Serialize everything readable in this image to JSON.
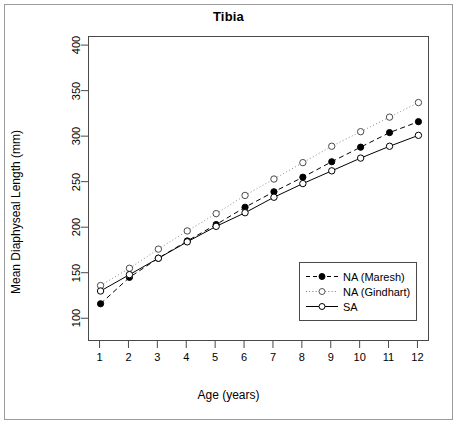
{
  "figure": {
    "title": "Tibia",
    "xlabel": "Age (years)",
    "ylabel": "Mean Diaphyseal Length (mm)"
  },
  "legend": {
    "items": [
      {
        "label": "NA (Maresh)",
        "key": "dashed-filled-circle"
      },
      {
        "label": "NA (Gindhart)",
        "key": "dotted-open-circle"
      },
      {
        "label": "SA",
        "key": "solid-open-circle"
      }
    ]
  },
  "axes": {
    "y_ticks": [
      100,
      150,
      200,
      250,
      300,
      350,
      400
    ],
    "x_ticks": [
      1,
      2,
      3,
      4,
      5,
      6,
      7,
      8,
      9,
      10,
      11,
      12
    ]
  },
  "chart_data": {
    "type": "line",
    "title": "Tibia",
    "xlabel": "Age (years)",
    "ylabel": "Mean Diaphyseal Length (mm)",
    "x": [
      1,
      2,
      3,
      4,
      5,
      6,
      7,
      8,
      9,
      10,
      11,
      12
    ],
    "xlim": [
      0.6,
      12.4
    ],
    "ylim": [
      75,
      410
    ],
    "grid": false,
    "legend_position": "bottom-right",
    "series": [
      {
        "name": "NA (Maresh)",
        "line_style": "dashed",
        "marker": "filled-circle",
        "color": "#000000",
        "values": [
          117,
          146,
          167,
          186,
          204,
          223,
          240,
          256,
          273,
          289,
          305,
          317
        ]
      },
      {
        "name": "NA (Gindhart)",
        "line_style": "dotted",
        "marker": "open-circle",
        "color": "#000000",
        "values": [
          137,
          156,
          177,
          197,
          216,
          236,
          254,
          272,
          290,
          306,
          322,
          338
        ]
      },
      {
        "name": "SA",
        "line_style": "solid",
        "marker": "open-circle",
        "color": "#000000",
        "values": [
          131,
          149,
          167,
          185,
          202,
          217,
          234,
          249,
          263,
          277,
          290,
          302
        ]
      }
    ]
  }
}
